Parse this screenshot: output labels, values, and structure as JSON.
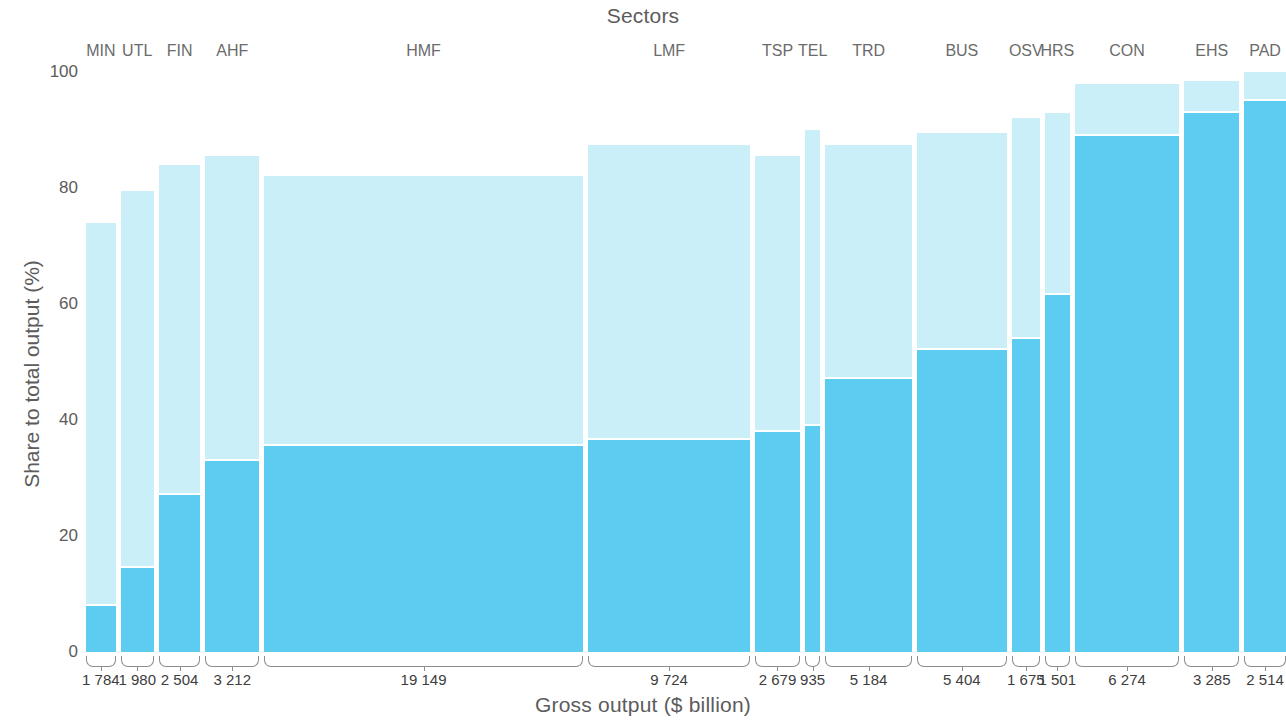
{
  "chart_data": {
    "type": "bar",
    "chart_style": "marimekko",
    "title": "Sectors",
    "xlabel": "Gross output ($ billion)",
    "ylabel": "Share to total output (%)",
    "ylim": [
      0,
      100
    ],
    "yticks": [
      100,
      80,
      60,
      40,
      20,
      0
    ],
    "grid": false,
    "x_total": 69770,
    "categories": [
      "MIN",
      "UTL",
      "FIN",
      "AHF",
      "HMF",
      "LMF",
      "TSP",
      "TEL",
      "TRD",
      "BUS",
      "OSV",
      "HRS",
      "CON",
      "EHS",
      "PAD"
    ],
    "widths": [
      1784,
      1980,
      2504,
      3212,
      19149,
      9724,
      2679,
      935,
      5184,
      5404,
      1675,
      1501,
      6274,
      3285,
      2514
    ],
    "width_labels": [
      "1 784",
      "1 980",
      "2 504",
      "3 212",
      "19 149",
      "9 724",
      "2 679",
      "935",
      "5 184",
      "5 404",
      "1 675",
      "1 501",
      "6 274",
      "3 285",
      "2 514"
    ],
    "series": [
      {
        "name": "lower-segment",
        "color": "#5ccdf0",
        "values": [
          8,
          14.5,
          27,
          33,
          35.5,
          36.5,
          38,
          39,
          47,
          52,
          54,
          61.5,
          89,
          93,
          95
        ]
      },
      {
        "name": "upper-segment",
        "color": "#cbeff8",
        "values": [
          74,
          79.5,
          84,
          85.5,
          82,
          87.5,
          85.5,
          90,
          87.5,
          89.5,
          92,
          93,
          98,
          98.5,
          100
        ]
      }
    ]
  },
  "axis": {
    "y_tick_labels": [
      "100",
      "80",
      "60",
      "40",
      "20",
      "0"
    ],
    "y_title": "Share to total output (%)",
    "x_title": "Gross output ($ billion)",
    "top_title": "Sectors"
  },
  "colors": {
    "light": "#cbeff8",
    "dark": "#5ccdf0",
    "text": "#5c5c5c",
    "bracket": "#8d8d8d",
    "background": "#ffffff"
  }
}
